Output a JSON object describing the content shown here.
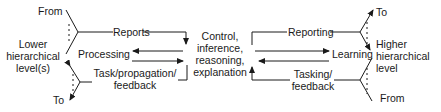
{
  "diagram": {
    "left": {
      "from": "From",
      "to": "To",
      "level_line1": "Lower",
      "level_line2": "hierarchical",
      "level_line3": "level(s)",
      "reports": "Reports",
      "processing": "Processing",
      "task_line1": "Task/propagation/",
      "task_line2": "feedback"
    },
    "center": {
      "line1": "Control,",
      "line2": "inference,",
      "line3": "reasoning,",
      "line4": "explanation"
    },
    "right": {
      "to": "To",
      "from": "From",
      "level_line1": "Higher",
      "level_line2": "hierarchical",
      "level_line3": "level",
      "reporting": "Reporting",
      "learning": "Learning",
      "tasking_line1": "Tasking/",
      "tasking_line2": "feedback"
    },
    "colors": {
      "stroke": "#1a1a1a",
      "background": "#ffffff"
    }
  }
}
